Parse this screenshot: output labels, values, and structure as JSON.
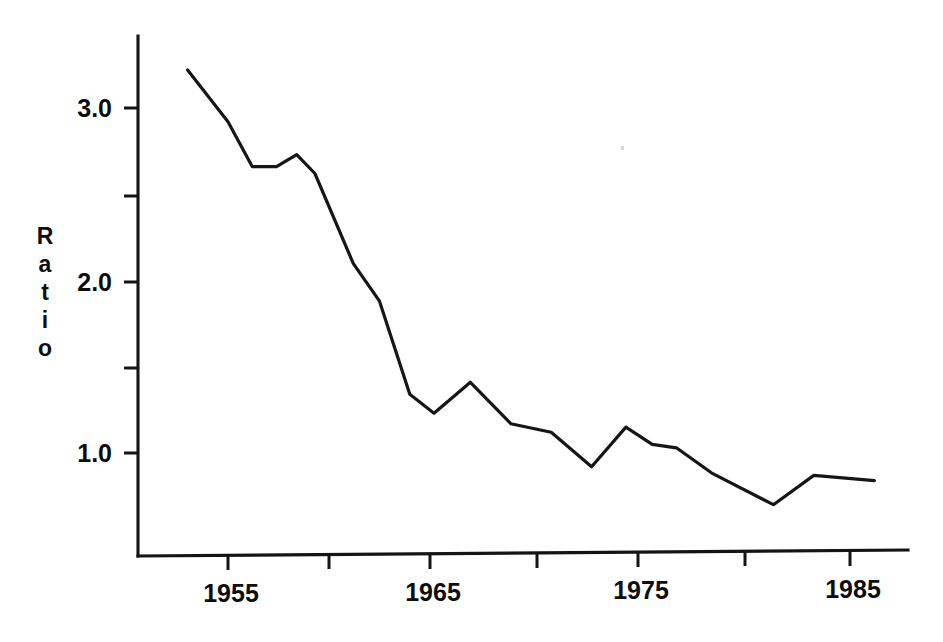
{
  "figure": {
    "background_color": "#ffffff",
    "ink_color": "#141414",
    "axis_label_y": "Ratio",
    "axis_label_y_letters": [
      "R",
      "a",
      "t",
      "i",
      "o"
    ]
  },
  "axes": {
    "y_tick_labels": [
      "3.0",
      "2.0",
      "1.0"
    ],
    "y_minor_ticks": [
      "2.5",
      "1.5"
    ],
    "x_tick_labels": [
      "1955",
      "1965",
      "1975",
      "1985"
    ],
    "x_minor_ticks": [
      "1960",
      "1970",
      "1980"
    ]
  },
  "chart_data": {
    "type": "line",
    "title": "",
    "xlabel": "",
    "ylabel": "Ratio",
    "xlim": [
      1952.2,
      1988.0
    ],
    "ylim": [
      0.4,
      3.4
    ],
    "xticks": [
      1955,
      1960,
      1965,
      1970,
      1975,
      1980,
      1985
    ],
    "xticklabels": [
      "1955",
      "",
      "1965",
      "",
      "1975",
      "",
      "1985"
    ],
    "yticks": [
      1.0,
      1.5,
      2.0,
      2.5,
      3.0
    ],
    "yticklabels": [
      "1.0",
      "",
      "2.0",
      "",
      "3.0"
    ],
    "grid": false,
    "legend": "none",
    "series": [
      {
        "name": "Ratio",
        "x": [
          1953.0,
          1955.0,
          1956.2,
          1957.4,
          1958.4,
          1959.3,
          1961.2,
          1962.5,
          1964.0,
          1965.2,
          1967.0,
          1969.0,
          1971.0,
          1973.0,
          1974.7,
          1976.0,
          1977.2,
          1979.0,
          1982.0,
          1984.0,
          1987.0
        ],
        "values": [
          3.22,
          2.92,
          2.66,
          2.66,
          2.73,
          2.62,
          2.1,
          1.88,
          1.34,
          1.23,
          1.41,
          1.17,
          1.12,
          0.92,
          1.15,
          1.05,
          1.03,
          0.88,
          0.7,
          0.87,
          0.84
        ]
      }
    ]
  }
}
